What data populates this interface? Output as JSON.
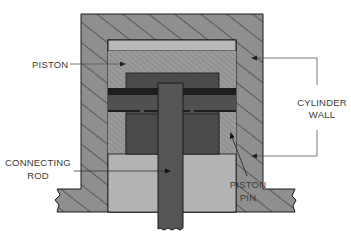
{
  "diagram": {
    "labels": {
      "piston": "PISTON",
      "cylinder_wall_line1": "CYLINDER",
      "cylinder_wall_line2": "WALL",
      "connecting_rod_line1": "CONNECTING",
      "connecting_rod_line2": "ROD",
      "piston_pin_line1": "PISTON",
      "piston_pin_line2": "PIN"
    },
    "colors": {
      "background": "#ffffff",
      "cylinder_wall": "#8f8f8f",
      "hatch_lines": "#2a2a2a",
      "top_band": "#b8b8b8",
      "piston_body": "#9a9a9a",
      "piston_hatch": "#7e7e7e",
      "pin_block": "#4a4a4a",
      "pin_band_dark": "#1e1e1e",
      "connecting_rod": "#555555",
      "lower_region": "#b3b3b3",
      "outline": "#1a1a1a",
      "leader_lines": "#555555",
      "label_text": "#3a3a3a"
    }
  }
}
